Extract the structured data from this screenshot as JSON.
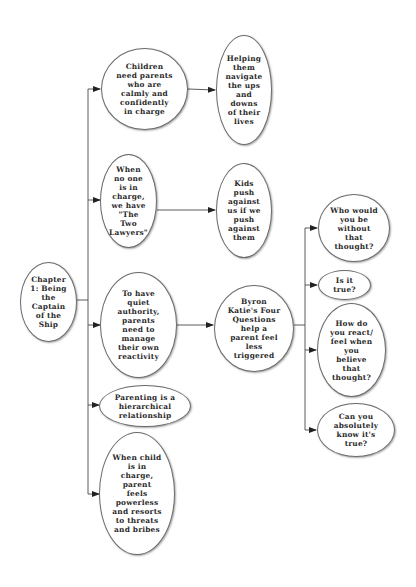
{
  "diagram": {
    "root": {
      "id": "root",
      "label": "Chapter\n1: Being\nthe\nCaptain\nof the\nShip"
    },
    "nodes": [
      {
        "id": "n1",
        "label": "Children\nneed parents\nwho are\ncalmly and\nconfidently\nin charge"
      },
      {
        "id": "n1a",
        "label": "Helping\nthem\nnavigate\nthe ups\nand\ndowns\nof their\nlives"
      },
      {
        "id": "n2",
        "label": "When\nno one\nis in\ncharge,\nwe have\n\"The\nTwo\nLawyers\""
      },
      {
        "id": "n2a",
        "label": "Kids\npush\nagainst\nus if we\npush\nagainst\nthem"
      },
      {
        "id": "n3",
        "label": "To have\nquiet\nauthority,\nparents\nneed to\nmanage\ntheir own\nreactivity"
      },
      {
        "id": "n3a",
        "label": "Byron\nKatie's Four\nQuestions\nhelp a\nparent feel\nless\ntriggered"
      },
      {
        "id": "q1",
        "label": "Who would\nyou be\nwithout\nthat\nthought?"
      },
      {
        "id": "q2",
        "label": "Is it\ntrue?"
      },
      {
        "id": "q3",
        "label": "How do\nyou react/\nfeel when\nyou\nbelieve\nthat\nthought?"
      },
      {
        "id": "q4",
        "label": "Can you\nabsolutely\nknow it's\ntrue?"
      },
      {
        "id": "n4",
        "label": "Parenting is a\nhierarchical\nrelationship"
      },
      {
        "id": "n5",
        "label": "When child\nis in\ncharge,\nparent\nfeels\npowerless\nand resorts\nto threats\nand bribes"
      }
    ],
    "edges": [
      {
        "from": "root",
        "to": "n1"
      },
      {
        "from": "root",
        "to": "n2"
      },
      {
        "from": "root",
        "to": "n3"
      },
      {
        "from": "root",
        "to": "n4"
      },
      {
        "from": "root",
        "to": "n5"
      },
      {
        "from": "n1",
        "to": "n1a"
      },
      {
        "from": "n2",
        "to": "n2a"
      },
      {
        "from": "n3",
        "to": "n3a"
      },
      {
        "from": "n3a",
        "to": "q1"
      },
      {
        "from": "n3a",
        "to": "q2"
      },
      {
        "from": "n3a",
        "to": "q3"
      },
      {
        "from": "n3a",
        "to": "q4"
      }
    ],
    "colors": {
      "line": "#4a4a4a",
      "border": "#6a6a6a",
      "text": "#2a2a2a",
      "background": "#ffffff"
    }
  }
}
